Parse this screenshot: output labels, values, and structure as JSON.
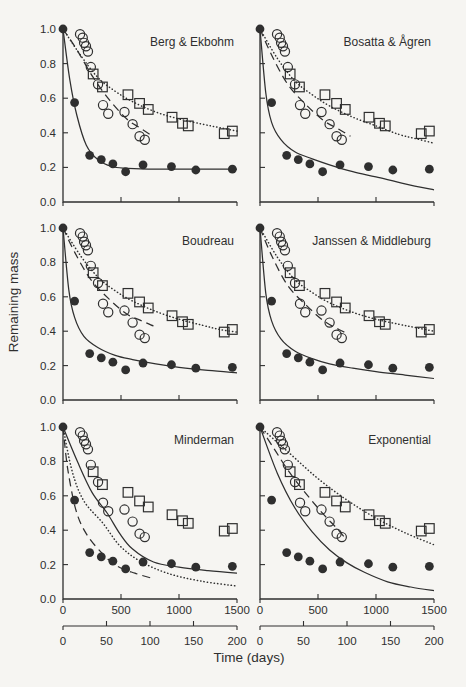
{
  "figure": {
    "background": "#f6f5f2",
    "ink": "#2f2f2f"
  },
  "chart_data": {
    "type": "line",
    "title": "",
    "xlabel": "Time (days)",
    "ylabel": "Remaining mass",
    "layout": {
      "panel_grid": {
        "rows": 3,
        "cols": 2
      },
      "grid_lines": "off",
      "legend": "none",
      "axis_style": "L-shaped, inward ticks, labels only on left column and bottom row"
    },
    "x_axis": {
      "unit": "days",
      "range": [
        0,
        1500
      ],
      "ticks": [
        0,
        500,
        1000,
        1500
      ]
    },
    "x_axis_secondary": {
      "unit": "days",
      "range": [
        0,
        200
      ],
      "ticks": [
        0,
        50,
        100,
        150,
        200
      ]
    },
    "y_axis": {
      "range": [
        0.0,
        1.0
      ],
      "tick_step": 0.2,
      "tick_labels": [
        "0.0",
        "0.2",
        "0.4",
        "0.6",
        "0.8",
        "1.0"
      ]
    },
    "point_series": [
      {
        "name": "filled circles",
        "marker": "filled-circle",
        "points": [
          [
            0,
            1.0
          ],
          [
            100,
            0.575
          ],
          [
            230,
            0.27
          ],
          [
            330,
            0.245
          ],
          [
            430,
            0.22
          ],
          [
            540,
            0.175
          ],
          [
            690,
            0.215
          ],
          [
            935,
            0.205
          ],
          [
            1145,
            0.185
          ],
          [
            1460,
            0.19
          ]
        ]
      },
      {
        "name": "open circles",
        "marker": "open-circle",
        "points": [
          [
            147,
            0.97
          ],
          [
            170,
            0.95
          ],
          [
            182,
            0.92
          ],
          [
            198,
            0.9
          ],
          [
            215,
            0.87
          ],
          [
            240,
            0.78
          ],
          [
            302,
            0.68
          ],
          [
            345,
            0.56
          ],
          [
            390,
            0.51
          ],
          [
            530,
            0.52
          ],
          [
            600,
            0.45
          ],
          [
            660,
            0.38
          ],
          [
            705,
            0.36
          ]
        ]
      },
      {
        "name": "open squares",
        "marker": "open-square",
        "points": [
          [
            260,
            0.74
          ],
          [
            340,
            0.665
          ],
          [
            560,
            0.62
          ],
          [
            660,
            0.57
          ],
          [
            735,
            0.535
          ],
          [
            940,
            0.49
          ],
          [
            1030,
            0.455
          ],
          [
            1080,
            0.44
          ],
          [
            1390,
            0.395
          ],
          [
            1460,
            0.41
          ]
        ]
      }
    ],
    "panels": [
      {
        "title": "Berg & Ekbohm",
        "fit_lines": {
          "solid": [
            [
              0,
              1.0
            ],
            [
              60,
              0.7
            ],
            [
              120,
              0.5
            ],
            [
              200,
              0.33
            ],
            [
              300,
              0.245
            ],
            [
              420,
              0.205
            ],
            [
              560,
              0.195
            ],
            [
              800,
              0.19
            ],
            [
              1100,
              0.19
            ],
            [
              1500,
              0.19
            ]
          ],
          "dashed": [
            [
              0,
              1.0
            ],
            [
              120,
              0.88
            ],
            [
              260,
              0.72
            ],
            [
              400,
              0.59
            ],
            [
              550,
              0.48
            ],
            [
              660,
              0.43
            ],
            [
              750,
              0.39
            ]
          ],
          "dotted": [
            [
              0,
              1.0
            ],
            [
              150,
              0.85
            ],
            [
              300,
              0.72
            ],
            [
              450,
              0.64
            ],
            [
              600,
              0.58
            ],
            [
              800,
              0.52
            ],
            [
              1000,
              0.48
            ],
            [
              1200,
              0.45
            ],
            [
              1350,
              0.43
            ],
            [
              1500,
              0.41
            ]
          ]
        }
      },
      {
        "title": "Bosatta & Ågren",
        "fit_lines": {
          "solid": [
            [
              0,
              1.0
            ],
            [
              50,
              0.63
            ],
            [
              100,
              0.46
            ],
            [
              180,
              0.36
            ],
            [
              300,
              0.29
            ],
            [
              450,
              0.25
            ],
            [
              600,
              0.215
            ],
            [
              800,
              0.175
            ],
            [
              1000,
              0.145
            ],
            [
              1250,
              0.105
            ],
            [
              1500,
              0.07
            ]
          ],
          "dashed": [
            [
              0,
              1.0
            ],
            [
              100,
              0.85
            ],
            [
              240,
              0.68
            ],
            [
              400,
              0.56
            ],
            [
              550,
              0.47
            ],
            [
              680,
              0.42
            ],
            [
              780,
              0.38
            ]
          ],
          "dotted": [
            [
              0,
              1.0
            ],
            [
              150,
              0.83
            ],
            [
              300,
              0.7
            ],
            [
              450,
              0.62
            ],
            [
              600,
              0.555
            ],
            [
              800,
              0.49
            ],
            [
              1000,
              0.44
            ],
            [
              1200,
              0.39
            ],
            [
              1350,
              0.365
            ],
            [
              1500,
              0.34
            ]
          ]
        }
      },
      {
        "title": "Boudreau",
        "fit_lines": {
          "solid": [
            [
              0,
              1.0
            ],
            [
              50,
              0.64
            ],
            [
              100,
              0.48
            ],
            [
              180,
              0.37
            ],
            [
              300,
              0.305
            ],
            [
              450,
              0.26
            ],
            [
              600,
              0.235
            ],
            [
              800,
              0.21
            ],
            [
              1000,
              0.19
            ],
            [
              1250,
              0.172
            ],
            [
              1500,
              0.158
            ]
          ],
          "dashed": [
            [
              0,
              1.0
            ],
            [
              100,
              0.86
            ],
            [
              240,
              0.7
            ],
            [
              400,
              0.585
            ],
            [
              550,
              0.5
            ],
            [
              680,
              0.46
            ],
            [
              780,
              0.43
            ]
          ],
          "dotted": [
            [
              0,
              1.0
            ],
            [
              150,
              0.84
            ],
            [
              300,
              0.715
            ],
            [
              450,
              0.635
            ],
            [
              600,
              0.575
            ],
            [
              800,
              0.515
            ],
            [
              1000,
              0.47
            ],
            [
              1200,
              0.435
            ],
            [
              1350,
              0.41
            ],
            [
              1500,
              0.395
            ]
          ]
        }
      },
      {
        "title": "Janssen & Middleburg",
        "fit_lines": {
          "solid": [
            [
              0,
              1.0
            ],
            [
              50,
              0.62
            ],
            [
              100,
              0.46
            ],
            [
              180,
              0.355
            ],
            [
              300,
              0.285
            ],
            [
              450,
              0.24
            ],
            [
              600,
              0.21
            ],
            [
              800,
              0.185
            ],
            [
              1000,
              0.165
            ],
            [
              1250,
              0.145
            ],
            [
              1500,
              0.125
            ]
          ],
          "dashed": [
            [
              0,
              1.0
            ],
            [
              100,
              0.84
            ],
            [
              240,
              0.665
            ],
            [
              400,
              0.55
            ],
            [
              550,
              0.46
            ],
            [
              680,
              0.41
            ],
            [
              760,
              0.385
            ]
          ],
          "dotted": [
            [
              0,
              1.0
            ],
            [
              150,
              0.83
            ],
            [
              300,
              0.7
            ],
            [
              450,
              0.625
            ],
            [
              600,
              0.565
            ],
            [
              800,
              0.51
            ],
            [
              1000,
              0.47
            ],
            [
              1200,
              0.44
            ],
            [
              1350,
              0.42
            ],
            [
              1500,
              0.4
            ]
          ]
        }
      },
      {
        "title": "Minderman",
        "fit_lines": {
          "solid": [
            [
              0,
              1.0
            ],
            [
              130,
              0.79
            ],
            [
              250,
              0.62
            ],
            [
              380,
              0.5
            ],
            [
              490,
              0.38
            ],
            [
              600,
              0.29
            ],
            [
              780,
              0.215
            ],
            [
              1000,
              0.185
            ],
            [
              1250,
              0.165
            ],
            [
              1500,
              0.15
            ]
          ],
          "dashed": [
            [
              0,
              1.0
            ],
            [
              40,
              0.76
            ],
            [
              110,
              0.52
            ],
            [
              200,
              0.38
            ],
            [
              345,
              0.26
            ],
            [
              470,
              0.19
            ],
            [
              620,
              0.15
            ],
            [
              770,
              0.12
            ]
          ],
          "dotted": [
            [
              0,
              1.0
            ],
            [
              80,
              0.74
            ],
            [
              180,
              0.57
            ],
            [
              345,
              0.44
            ],
            [
              490,
              0.31
            ],
            [
              665,
              0.22
            ],
            [
              900,
              0.15
            ],
            [
              1180,
              0.105
            ],
            [
              1500,
              0.075
            ]
          ]
        }
      },
      {
        "title": "Exponential",
        "fit_lines": {
          "solid": [
            [
              0,
              1.0
            ],
            [
              150,
              0.73
            ],
            [
              300,
              0.53
            ],
            [
              450,
              0.39
            ],
            [
              600,
              0.285
            ],
            [
              750,
              0.21
            ],
            [
              900,
              0.155
            ],
            [
              1100,
              0.1
            ],
            [
              1300,
              0.07
            ],
            [
              1500,
              0.048
            ]
          ],
          "dashed": [
            [
              0,
              1.0
            ],
            [
              125,
              0.87
            ],
            [
              250,
              0.74
            ],
            [
              400,
              0.61
            ],
            [
              550,
              0.49
            ],
            [
              650,
              0.42
            ],
            [
              740,
              0.35
            ]
          ],
          "dotted": [
            [
              0,
              1.0
            ],
            [
              250,
              0.85
            ],
            [
              500,
              0.7
            ],
            [
              750,
              0.575
            ],
            [
              1000,
              0.47
            ],
            [
              1250,
              0.385
            ],
            [
              1500,
              0.315
            ]
          ]
        }
      }
    ]
  }
}
